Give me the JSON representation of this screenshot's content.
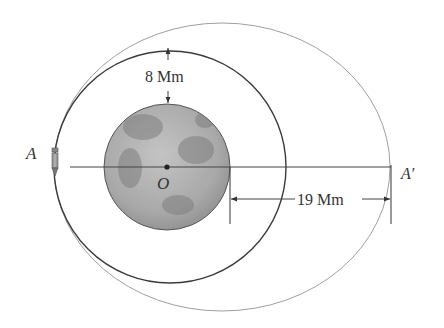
{
  "figure": {
    "labels": {
      "point_a": "A",
      "point_a_prime": "A′",
      "center": "O",
      "altitude": "8 Mm",
      "apoapsis_distance": "19 Mm"
    },
    "colors": {
      "circular_orbit": "#3a3a3a",
      "elliptical_orbit": "#9a9a9a",
      "moon_base": "#a8a8a8",
      "moon_dark": "#7d7d7d",
      "lines": "#444444"
    }
  }
}
